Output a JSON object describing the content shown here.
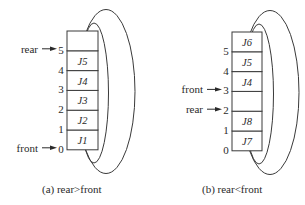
{
  "figure": {
    "panels": [
      {
        "id": "a",
        "caption": "(a) rear>front",
        "cells": [
          "J1",
          "J2",
          "J3",
          "J4",
          "J5",
          ""
        ],
        "indices": [
          "0",
          "1",
          "2",
          "3",
          "4",
          "5"
        ],
        "pointers": [
          {
            "label": "rear",
            "index": 5
          },
          {
            "label": "front",
            "index": 0
          }
        ]
      },
      {
        "id": "b",
        "caption": "(b) rear<front",
        "cells": [
          "J7",
          "J8",
          "",
          "J4",
          "J5",
          "J6"
        ],
        "indices": [
          "0",
          "1",
          "2",
          "3",
          "4",
          "5"
        ],
        "pointers": [
          {
            "label": "front",
            "index": 3
          },
          {
            "label": "rear",
            "index": 2
          }
        ]
      }
    ]
  }
}
